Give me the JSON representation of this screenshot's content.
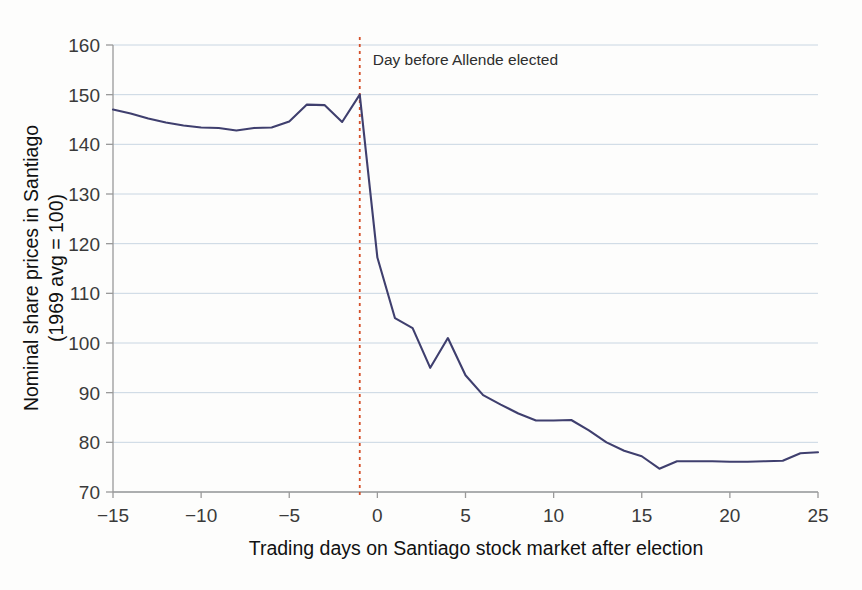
{
  "figure": {
    "background_color": "#fdfdfc",
    "series_color": "#3f3f6e",
    "event_line_color": "#d4502a",
    "gridline_color": "#c9d6e2"
  },
  "chart_data": {
    "type": "line",
    "title": "",
    "subtitle": "",
    "xlabel": "Trading days on Santiago stock market after election",
    "ylabel": "Nominal share prices in Santiago\n(1969 avg = 100)",
    "ylabel_line1": "Nominal share prices in Santiago",
    "ylabel_line2": "(1969 avg = 100)",
    "xlim": [
      -15,
      25
    ],
    "ylim": [
      70,
      160
    ],
    "xticks": [
      -15,
      -10,
      -5,
      0,
      5,
      10,
      15,
      20,
      25
    ],
    "xtick_labels": [
      "−15",
      "−10",
      "−5",
      "0",
      "5",
      "10",
      "15",
      "20",
      "25"
    ],
    "yticks": [
      70,
      80,
      90,
      100,
      110,
      120,
      130,
      140,
      150,
      160
    ],
    "ytick_labels": [
      "70",
      "80",
      "90",
      "100",
      "110",
      "120",
      "130",
      "140",
      "150",
      "160"
    ],
    "grid": true,
    "grid_axis": "y",
    "legend": false,
    "legend_position": "none",
    "x": [
      -15,
      -14,
      -13,
      -12,
      -11,
      -10,
      -9,
      -8,
      -7,
      -6,
      -5,
      -4,
      -3,
      -2,
      -1,
      0,
      1,
      2,
      3,
      4,
      5,
      6,
      7,
      8,
      9,
      10,
      11,
      12,
      13,
      14,
      15,
      16,
      17,
      18,
      19,
      20,
      21,
      22,
      23,
      24,
      25
    ],
    "values": [
      147.0,
      146.2,
      145.2,
      144.4,
      143.8,
      143.4,
      143.3,
      142.8,
      143.3,
      143.4,
      144.6,
      148.0,
      147.9,
      144.5,
      150.0,
      117.2,
      105.0,
      103.0,
      95.0,
      101.0,
      93.5,
      89.5,
      87.6,
      85.8,
      84.4,
      84.4,
      84.5,
      82.4,
      80.0,
      78.3,
      77.2,
      74.7,
      76.2,
      76.2,
      76.2,
      76.1,
      76.1,
      76.2,
      76.3,
      77.8,
      78.0
    ],
    "series": [
      {
        "name": "Nominal share prices in Santiago (1969 avg = 100)",
        "color": "#3f3f6e",
        "values": [
          147.0,
          146.2,
          145.2,
          144.4,
          143.8,
          143.4,
          143.3,
          142.8,
          143.3,
          143.4,
          144.6,
          148.0,
          147.9,
          144.5,
          150.0,
          117.2,
          105.0,
          103.0,
          95.0,
          101.0,
          93.5,
          89.5,
          87.6,
          85.8,
          84.4,
          84.4,
          84.5,
          82.4,
          80.0,
          78.3,
          77.2,
          74.7,
          76.2,
          76.2,
          76.2,
          76.1,
          76.1,
          76.2,
          76.3,
          77.8,
          78.0
        ]
      }
    ],
    "annotations": [
      {
        "text": "Day before Allende elected",
        "x": -1,
        "type": "vertical-line-with-label",
        "line_style": "dotted",
        "color": "#d4502a"
      }
    ]
  }
}
